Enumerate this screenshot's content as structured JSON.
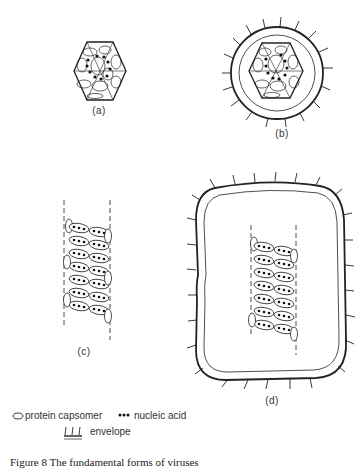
{
  "figure": {
    "panels": [
      {
        "id": "a",
        "label": "(a)",
        "description": "icosahedral naked virus"
      },
      {
        "id": "b",
        "label": "(b)",
        "description": "icosahedral enveloped virus"
      },
      {
        "id": "c",
        "label": "(c)",
        "description": "helical naked virus"
      },
      {
        "id": "d",
        "label": "(d)",
        "description": "helical enveloped virus"
      }
    ],
    "legend": {
      "capsomer": "protein capsomer",
      "nucleic_acid": "nucleic acid",
      "envelope": "envelope"
    },
    "caption": "Figure 8  The fundamental forms of viruses"
  },
  "colors": {
    "ink": "#222222",
    "background": "#ffffff"
  }
}
